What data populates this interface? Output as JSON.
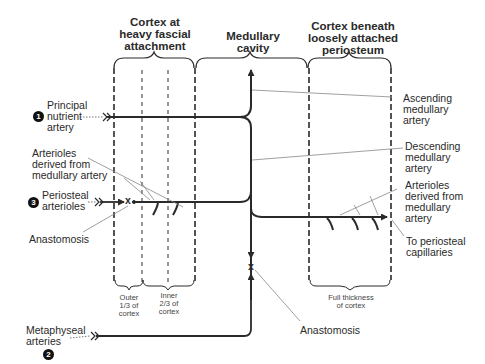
{
  "headers": {
    "cortex_heavy": "Cortex at\nheavy fascial\nattachment",
    "medullary": "Medullary\ncavity",
    "cortex_loose": "Cortex beneath\nloosely attached\nperiosteum"
  },
  "left_labels": {
    "principal": "Principal\nnutrient\nartery",
    "arterioles_left": "Arterioles\nderived from\nmedullary artery",
    "periosteal": "Periosteal\narterioles",
    "anastomosis_left": "Anastomosis",
    "metaphyseal": "Metaphyseal\narteries"
  },
  "right_labels": {
    "ascending": "Ascending\nmedullary\nartery",
    "descending": "Descending\nmedullary\nartery",
    "arterioles_right": "Arterioles\nderived from\nmedullary\nartery",
    "to_periosteal": "To periosteal\ncapillaries",
    "anastomosis_bottom": "Anastomosis"
  },
  "sub_labels": {
    "outer": "Outer\n1/3 of\ncortex",
    "inner": "Inner\n2/3 of\ncortex",
    "full": "Full thickness\nof cortex"
  },
  "markers": {
    "one": "1",
    "two": "2",
    "three": "3",
    "anastomosis_mark": "x"
  },
  "colors": {
    "line": "#2a2a2a",
    "leader": "#888888"
  }
}
